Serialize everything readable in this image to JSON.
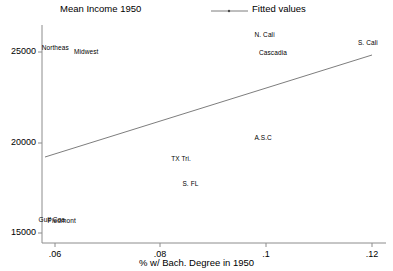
{
  "chart_data": {
    "type": "scatter",
    "title": "Mean Income 1950",
    "xlabel": "% w/ Bach. Degree in 1950",
    "ylabel": "",
    "xlim": [
      0.0555,
      0.1255
    ],
    "ylim": [
      15000,
      26200
    ],
    "grid": false,
    "legend_position": "top-right",
    "legend": [
      {
        "label": "Fitted values",
        "marker": "line"
      }
    ],
    "xticks": [
      ".06",
      ".08",
      ".1",
      ".12"
    ],
    "xtick_values": [
      0.06,
      0.08,
      0.1,
      0.12
    ],
    "yticks": [
      "25000",
      "20000",
      "15000"
    ],
    "ytick_values": [
      25000,
      20000,
      15000
    ],
    "points": [
      {
        "label": "Northeas",
        "x": 0.0582,
        "y": 25030
      },
      {
        "label": "Midwest",
        "x": 0.0645,
        "y": 24800
      },
      {
        "label": "N. Cali",
        "x": 0.1008,
        "y": 25700
      },
      {
        "label": "S. Cali",
        "x": 0.1218,
        "y": 25260
      },
      {
        "label": "Cascadia",
        "x": 0.1025,
        "y": 24740
      },
      {
        "label": "A.S.C",
        "x": 0.1005,
        "y": 20420
      },
      {
        "label": "TX Tri.",
        "x": 0.0838,
        "y": 19310
      },
      {
        "label": "S. FL",
        "x": 0.0857,
        "y": 18030
      },
      {
        "label": "Gulf Coa",
        "x": 0.0575,
        "y": 16170
      },
      {
        "label": "Piedmont",
        "x": 0.0595,
        "y": 16130
      }
    ],
    "fit_line": {
      "name": "Fitted values",
      "x0": 0.0563,
      "y0": 19350,
      "x1": 0.1218,
      "y1": 24960
    }
  },
  "colors": {
    "axis": "#8c8c8c",
    "line": "#6e6e6e",
    "text": "#000000",
    "background": "#ffffff"
  }
}
